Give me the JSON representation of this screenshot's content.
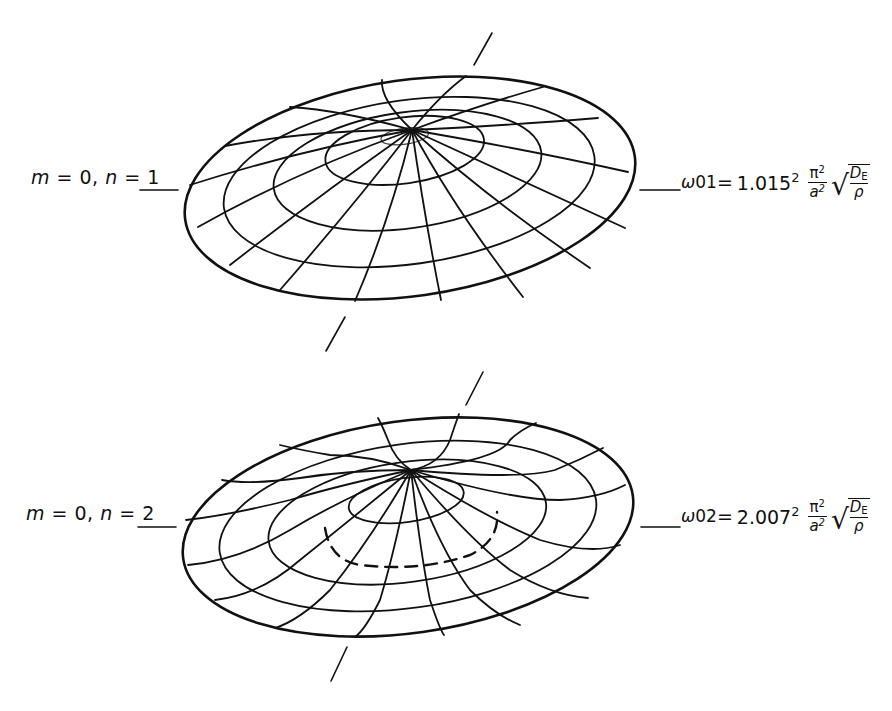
{
  "figure": {
    "modes": [
      {
        "id": "mode-01",
        "label_m": "m",
        "label_m_eq": " = 0, ",
        "label_n": "n",
        "label_n_eq": " = 1",
        "freq_symbol": "ω",
        "freq_subscript": "01",
        "equals": " = ",
        "coefficient": "1.015",
        "coef_exp": "2",
        "frac_num": "π",
        "frac_num_exp": "2",
        "frac_den": "a",
        "frac_den_exp": "2",
        "sqrt_num": "D",
        "sqrt_num_sub": "E",
        "sqrt_den": "ρ",
        "nodal_circles": 0,
        "dashed_nodal_circle": false
      },
      {
        "id": "mode-02",
        "label_m": "m",
        "label_m_eq": " = 0, ",
        "label_n": "n",
        "label_n_eq": " = 2",
        "freq_symbol": "ω",
        "freq_subscript": "02",
        "equals": " = ",
        "coefficient": "2.007",
        "coef_exp": "2",
        "frac_num": "π",
        "frac_num_exp": "2",
        "frac_den": "a",
        "frac_den_exp": "2",
        "sqrt_num": "D",
        "sqrt_num_sub": "E",
        "sqrt_den": "ρ",
        "nodal_circles": 1,
        "dashed_nodal_circle": true
      }
    ],
    "colors": {
      "line": "#111111",
      "background": "#ffffff"
    }
  }
}
